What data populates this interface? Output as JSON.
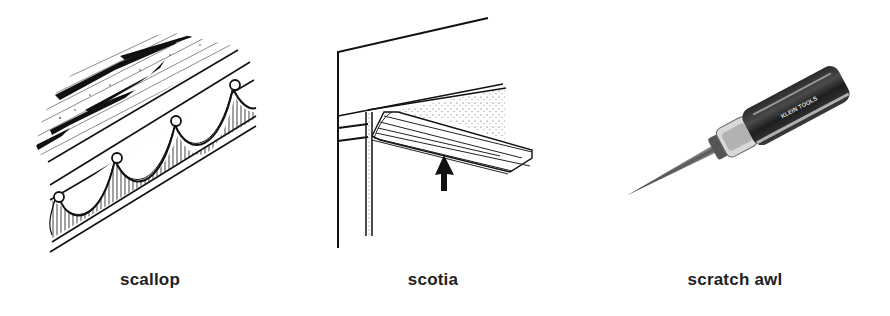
{
  "page": {
    "background": "#ffffff",
    "ink_color": "#222222"
  },
  "figures": [
    {
      "caption": "scallop",
      "icon": "scallop-molding-illustration"
    },
    {
      "caption": "scotia",
      "icon": "scotia-molding-illustration"
    },
    {
      "caption": "scratch awl",
      "icon": "scratch-awl-photo",
      "handle_text": "KLEIN TOOLS"
    }
  ]
}
